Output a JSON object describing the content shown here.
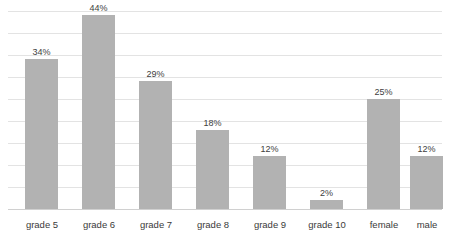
{
  "chart_data": {
    "type": "bar",
    "title": "",
    "subtitle": "",
    "xlabel": "",
    "ylabel": "",
    "ylim": [
      0,
      45
    ],
    "grid": true,
    "gridlines": 9,
    "legend": "none",
    "value_suffix": "%",
    "bar_color": "#b2b2b2",
    "gridline_color": "#e3e3e3",
    "axis_color": "#d0d0d0",
    "categories": [
      "grade 5",
      "grade 6",
      "grade 7",
      "grade 8",
      "grade 9",
      "grade 10",
      "female",
      "male"
    ],
    "values": [
      34,
      44,
      29,
      18,
      12,
      2,
      25,
      12
    ],
    "labels": [
      "34%",
      "44%",
      "29%",
      "18%",
      "12%",
      "2%",
      "25%",
      "12%"
    ],
    "groups": [
      {
        "name": "grade",
        "categories": [
          "grade 5",
          "grade 6",
          "grade 7",
          "grade 8",
          "grade 9",
          "grade 10"
        ]
      },
      {
        "name": "gender",
        "categories": [
          "female",
          "male"
        ]
      }
    ],
    "bar_left_px": [
      25,
      82,
      139,
      196,
      253,
      310,
      367,
      410
    ],
    "bar_width_px": 33,
    "gap_after_index": 5
  }
}
